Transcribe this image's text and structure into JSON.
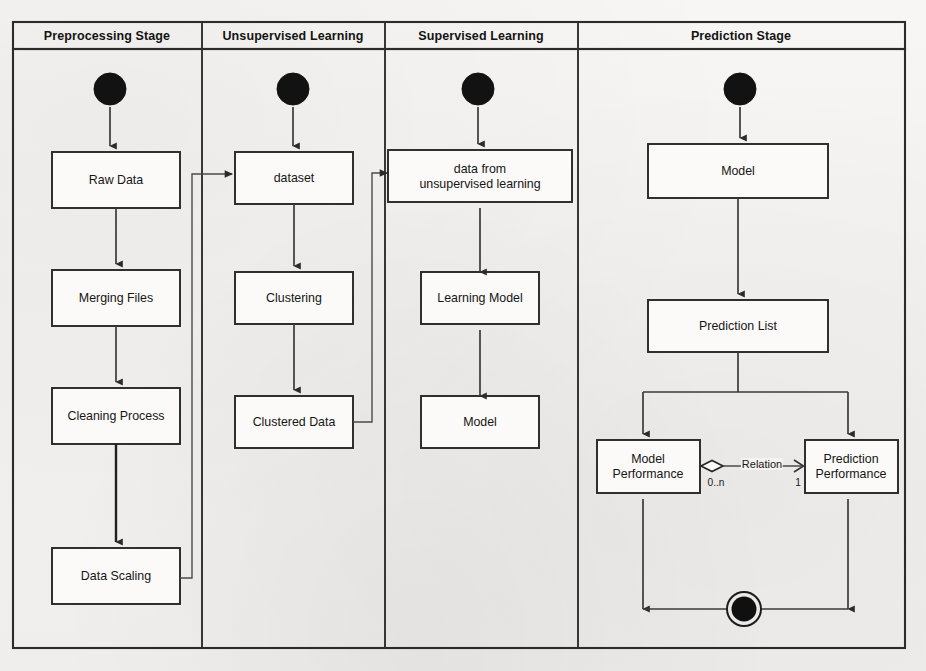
{
  "diagram": {
    "type": "uml-activity-diagram",
    "lanes": [
      {
        "id": "preprocessing",
        "title": "Preprocessing Stage"
      },
      {
        "id": "unsupervised",
        "title": "Unsupervised Learning"
      },
      {
        "id": "supervised",
        "title": "Supervised Learning"
      },
      {
        "id": "prediction",
        "title": "Prediction Stage"
      }
    ],
    "nodes": [
      {
        "id": "start-preprocessing",
        "lane": "preprocessing",
        "kind": "initial-node",
        "label": ""
      },
      {
        "id": "raw-data",
        "lane": "preprocessing",
        "kind": "activity",
        "label": "Raw Data"
      },
      {
        "id": "merging-files",
        "lane": "preprocessing",
        "kind": "activity",
        "label": "Merging Files"
      },
      {
        "id": "cleaning-process",
        "lane": "preprocessing",
        "kind": "activity",
        "label": "Cleaning Process"
      },
      {
        "id": "data-scaling",
        "lane": "preprocessing",
        "kind": "activity",
        "label": "Data Scaling"
      },
      {
        "id": "start-unsupervised",
        "lane": "unsupervised",
        "kind": "initial-node",
        "label": ""
      },
      {
        "id": "dataset",
        "lane": "unsupervised",
        "kind": "activity",
        "label": "dataset"
      },
      {
        "id": "clustering",
        "lane": "unsupervised",
        "kind": "activity",
        "label": "Clustering"
      },
      {
        "id": "clustered-data",
        "lane": "unsupervised",
        "kind": "activity",
        "label": "Clustered Data"
      },
      {
        "id": "start-supervised",
        "lane": "supervised",
        "kind": "initial-node",
        "label": ""
      },
      {
        "id": "data-from-unsupervised",
        "lane": "supervised",
        "kind": "activity",
        "label": "data from\nunsupervised learning"
      },
      {
        "id": "learning-model",
        "lane": "supervised",
        "kind": "activity",
        "label": "Learning Model"
      },
      {
        "id": "model-supervised",
        "lane": "supervised",
        "kind": "activity",
        "label": "Model"
      },
      {
        "id": "start-prediction",
        "lane": "prediction",
        "kind": "initial-node",
        "label": ""
      },
      {
        "id": "model-prediction",
        "lane": "prediction",
        "kind": "activity",
        "label": "Model"
      },
      {
        "id": "prediction-list",
        "lane": "prediction",
        "kind": "activity",
        "label": "Prediction List"
      },
      {
        "id": "model-performance",
        "lane": "prediction",
        "kind": "activity",
        "label": "Model\nPerformance"
      },
      {
        "id": "prediction-performance",
        "lane": "prediction",
        "kind": "activity",
        "label": "Prediction\nPerformance"
      },
      {
        "id": "final-node",
        "lane": "prediction",
        "kind": "final-node",
        "label": ""
      }
    ],
    "association": {
      "label": "Relation",
      "source_multiplicity": "0..n",
      "target_multiplicity": "1",
      "source": "model-performance",
      "target": "prediction-performance",
      "source_end": "aggregation-diamond",
      "target_end": "open-arrow"
    },
    "colors": {
      "background": "#f4f3f1",
      "line": "#2b2b2b",
      "box_fill": "#fbfaf8",
      "text": "#161616"
    }
  }
}
